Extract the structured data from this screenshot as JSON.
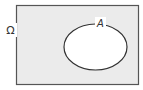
{
  "diagram": {
    "type": "venn",
    "universe": {
      "label": "Ω",
      "fill": "#ebebeb",
      "stroke": "#555555"
    },
    "sets": [
      {
        "label": "A",
        "fill": "#ffffff",
        "stroke": "#333333"
      }
    ]
  }
}
